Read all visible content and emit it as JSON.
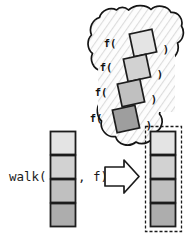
{
  "figure": {
    "name": "walk-higher-order-function-diagram",
    "expression_prefix": "walk(",
    "expression_suffix": ", f)",
    "arrow_glyph": "right-arrow",
    "background_color": "#ffffff",
    "outline_color": "#1b1b1b"
  },
  "input_list": {
    "name": "input-collection",
    "cell_count": 4,
    "x": 50,
    "y": 131,
    "cell_width": 26,
    "cell_height": 24,
    "cells": [
      {
        "index": 0,
        "fill": "#e4e4e4"
      },
      {
        "index": 1,
        "fill": "#d2d2d2"
      },
      {
        "index": 2,
        "fill": "#c0c0c0"
      },
      {
        "index": 3,
        "fill": "#adadad"
      }
    ]
  },
  "cloud": {
    "name": "function-application-cloud",
    "fill": "#fdfdfd",
    "hatch_color": "#d9d9d9",
    "stroke": "#141414",
    "call_open": "f(",
    "call_close": ")",
    "applications": [
      {
        "index": 0,
        "open": "f(",
        "close": ")",
        "fill": "#e4e4e4",
        "cx": 143,
        "cy": 43,
        "size": 23,
        "rotation": -12,
        "label_x": 110,
        "label_y": 47,
        "close_x": 166,
        "close_y": 53
      },
      {
        "index": 1,
        "open": "f(",
        "close": ")",
        "fill": "#d2d2d2",
        "cx": 137,
        "cy": 68,
        "size": 23,
        "rotation": -12,
        "label_x": 106,
        "label_y": 71,
        "close_x": 160,
        "close_y": 78
      },
      {
        "index": 2,
        "open": "f(",
        "close": ")",
        "fill": "#c0c0c0",
        "cx": 131,
        "cy": 93,
        "size": 23,
        "rotation": -12,
        "label_x": 101,
        "label_y": 96,
        "close_x": 154,
        "close_y": 103
      },
      {
        "index": 3,
        "open": "f(",
        "close": ")",
        "fill": "#9e9e9e",
        "cx": 126,
        "cy": 119,
        "size": 23,
        "rotation": -12,
        "label_x": 96,
        "label_y": 122,
        "close_x": 149,
        "close_y": 129
      }
    ]
  },
  "output_list": {
    "name": "output-collection",
    "cell_count": 4,
    "x": 150,
    "y": 131,
    "cell_width": 26,
    "cell_height": 24,
    "frame": {
      "x": 145,
      "y": 126,
      "width": 37,
      "height": 106,
      "dash": "3 2"
    },
    "cells": [
      {
        "index": 0,
        "fill": "#e4e4e4"
      },
      {
        "index": 1,
        "fill": "#d2d2d2"
      },
      {
        "index": 2,
        "fill": "#c0c0c0"
      },
      {
        "index": 3,
        "fill": "#adadad"
      }
    ]
  }
}
